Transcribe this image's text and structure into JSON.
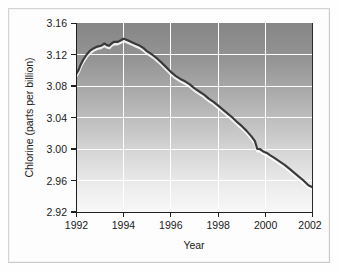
{
  "figure": {
    "name": "chlorine-time-series-figure",
    "background_color": "#fefefe",
    "frame_color": "#d4d4d4"
  },
  "chart_data": {
    "type": "line",
    "title": "",
    "xlabel": "Year",
    "ylabel": "Chlorine (parts per billion)",
    "xlim": [
      1992,
      2002
    ],
    "ylim": [
      2.92,
      3.16
    ],
    "xticks": [
      1992,
      1994,
      1996,
      1998,
      2000,
      2002
    ],
    "xticklabels": [
      "1992",
      "1994",
      "1996",
      "1998",
      "2000",
      "2002"
    ],
    "yticks": [
      2.92,
      2.96,
      3.0,
      3.04,
      3.08,
      3.12,
      3.16
    ],
    "yticklabels": [
      "2.92",
      "2.96",
      "3.00",
      "3.04",
      "3.08",
      "3.12",
      "3.16"
    ],
    "grid": true,
    "grid_color": "#ffffff",
    "legend": false,
    "legend_position": "none",
    "plot_background": "vertical-gradient-gray-to-white",
    "plot_bg_top_color": "#888888",
    "plot_bg_bottom_color": "#f7f7f7",
    "line_color": "#3a3a3a",
    "line_width": 2.2,
    "series": [
      {
        "name": "Chlorine",
        "units": "parts per billion",
        "x": [
          1992.0,
          1992.1,
          1992.2,
          1992.3,
          1992.45,
          1992.6,
          1992.75,
          1992.9,
          1993.05,
          1993.2,
          1993.3,
          1993.4,
          1993.5,
          1993.6,
          1993.75,
          1993.9,
          1994.0,
          1994.1,
          1994.25,
          1994.4,
          1994.55,
          1994.7,
          1994.85,
          1995.0,
          1995.15,
          1995.3,
          1995.45,
          1995.6,
          1995.8,
          1996.0,
          1996.2,
          1996.4,
          1996.6,
          1996.8,
          1997.0,
          1997.2,
          1997.4,
          1997.6,
          1997.8,
          1998.0,
          1998.2,
          1998.4,
          1998.6,
          1998.8,
          1999.0,
          1999.2,
          1999.4,
          1999.55,
          1999.65,
          1999.75,
          1999.9,
          2000.05,
          2000.2,
          2000.4,
          2000.6,
          2000.8,
          2001.0,
          2001.2,
          2001.4,
          2001.6,
          2001.8,
          2002.0
        ],
        "y": [
          3.095,
          3.1,
          3.107,
          3.113,
          3.12,
          3.125,
          3.128,
          3.13,
          3.131,
          3.134,
          3.132,
          3.131,
          3.134,
          3.136,
          3.136,
          3.138,
          3.14,
          3.139,
          3.137,
          3.135,
          3.133,
          3.131,
          3.128,
          3.124,
          3.121,
          3.118,
          3.114,
          3.11,
          3.104,
          3.098,
          3.093,
          3.089,
          3.086,
          3.082,
          3.077,
          3.073,
          3.069,
          3.064,
          3.06,
          3.055,
          3.05,
          3.045,
          3.04,
          3.034,
          3.029,
          3.023,
          3.016,
          3.01,
          3.0,
          3.0,
          2.997,
          2.995,
          2.992,
          2.988,
          2.984,
          2.98,
          2.975,
          2.97,
          2.965,
          2.96,
          2.954,
          2.951
        ]
      }
    ],
    "peak": {
      "x": 1994.0,
      "y": 3.14
    },
    "start": {
      "x": 1992.0,
      "y": 3.095
    },
    "end": {
      "x": 2002.0,
      "y": 2.951
    }
  }
}
